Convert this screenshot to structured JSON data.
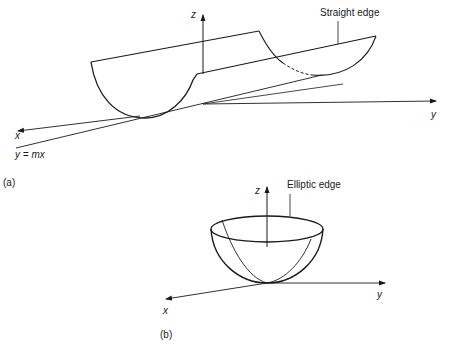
{
  "figure": {
    "panel_a": {
      "caption": "(a)",
      "labels": {
        "z_axis": "z",
        "y_axis": "y",
        "x_axis": "x",
        "line_equation": "y = mx",
        "edge_annotation": "Straight edge"
      },
      "shape": "parabolic cylinder (trough) tangent to plane along line y = mx"
    },
    "panel_b": {
      "caption": "(b)",
      "labels": {
        "z_axis": "z",
        "y_axis": "y",
        "x_axis": "x",
        "edge_annotation": "Elliptic edge"
      },
      "shape": "elliptic paraboloid (bowl) touching origin"
    },
    "colors": {
      "stroke": "#1a1a1a",
      "background": "#ffffff"
    }
  }
}
